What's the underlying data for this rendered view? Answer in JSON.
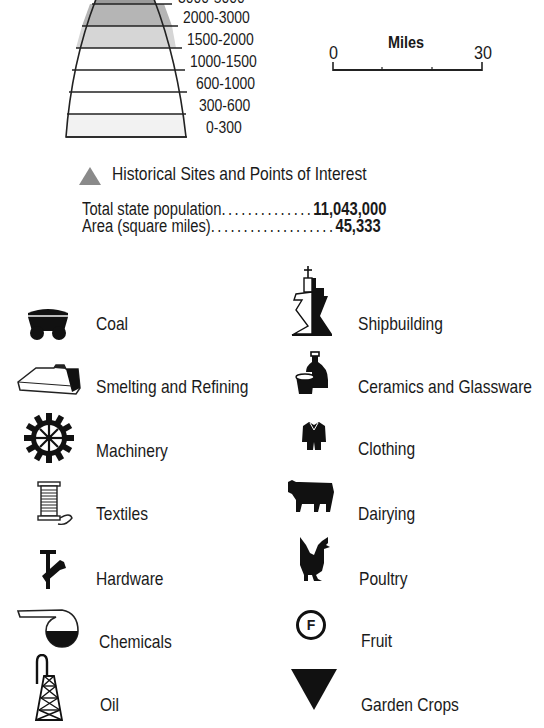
{
  "elevation_legend": {
    "bands": [
      {
        "label": "3000-5000",
        "fill": "#9a9a9a",
        "clipped": true
      },
      {
        "label": "2000-3000",
        "fill": "#b5b5b5"
      },
      {
        "label": "1500-2000",
        "fill": "#d6d6d6"
      },
      {
        "label": "1000-1500",
        "fill": "#ffffff"
      },
      {
        "label": "600-1000",
        "fill": "#ffffff"
      },
      {
        "label": "300-600",
        "fill": "#ffffff"
      },
      {
        "label": "0-300",
        "fill": "#f2f2f2"
      }
    ]
  },
  "scale_bar": {
    "title": "Miles",
    "start": "0",
    "end": "30"
  },
  "historical_sites": {
    "label": "Historical Sites and Points of Interest",
    "color": "#8a8a8a"
  },
  "stats": [
    {
      "label": "Total state population",
      "dots": "..............",
      "value": "11,043,000"
    },
    {
      "label": "Area (square miles)",
      "dots": "...................",
      "value": "45,333"
    }
  ],
  "industries_left": [
    {
      "label": "Coal",
      "icon": "coal-cart-icon"
    },
    {
      "label": "Smelting and Refining",
      "icon": "smelter-icon"
    },
    {
      "label": "Machinery",
      "icon": "gear-icon"
    },
    {
      "label": "Textiles",
      "icon": "thread-spool-icon"
    },
    {
      "label": "Hardware",
      "icon": "hammer-wrench-icon"
    },
    {
      "label": "Chemicals",
      "icon": "retort-flask-icon"
    },
    {
      "label": "Oil",
      "icon": "oil-derrick-icon"
    }
  ],
  "industries_right": [
    {
      "label": "Shipbuilding",
      "icon": "ship-icon"
    },
    {
      "label": "Ceramics and Glassware",
      "icon": "vase-cup-icon"
    },
    {
      "label": "Clothing",
      "icon": "jacket-icon"
    },
    {
      "label": "Dairying",
      "icon": "cow-icon"
    },
    {
      "label": "Poultry",
      "icon": "rooster-icon"
    },
    {
      "label": "Fruit",
      "icon": "fruit-circle-f-icon",
      "glyph": "F"
    },
    {
      "label": "Garden Crops",
      "icon": "inverted-triangle-icon"
    }
  ]
}
